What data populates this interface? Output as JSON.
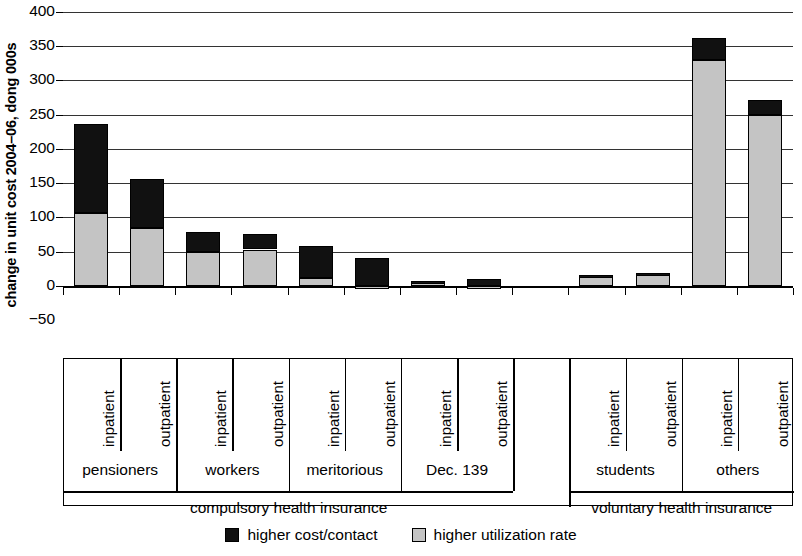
{
  "chart_data": {
    "type": "bar",
    "title": "",
    "subtitle": "",
    "stacked": true,
    "ylabel": "change in unit cost 2004–06, dong 000s",
    "xlabel": "",
    "ylim": [
      -50,
      400
    ],
    "yticks": [
      -50,
      0,
      50,
      100,
      150,
      200,
      250,
      300,
      350,
      400
    ],
    "ytick_labels": [
      "−50",
      "0",
      "50",
      "100",
      "150",
      "200",
      "250",
      "300",
      "350",
      "400"
    ],
    "grid": true,
    "legend_position": "bottom",
    "categories": [
      "pensioners inpatient",
      "pensioners outpatient",
      "workers inpatient",
      "workers outpatient",
      "meritorious inpatient",
      "meritorious outpatient",
      "Dec. 139 inpatient",
      "Dec. 139 outpatient",
      "students inpatient",
      "students outpatient",
      "others inpatient",
      "others outpatient"
    ],
    "series": [
      {
        "name": "higher utilization rate",
        "color": "#c4c4c4",
        "values": [
          107,
          85,
          50,
          53,
          12,
          -3,
          6,
          -2,
          14,
          17,
          330,
          250
        ]
      },
      {
        "name": "higher cost/contact",
        "color": "#111111",
        "values": [
          130,
          71,
          28,
          22,
          46,
          40,
          1,
          10,
          2,
          2,
          32,
          21
        ]
      }
    ],
    "totals": [
      237,
      156,
      78,
      75,
      58,
      37,
      7,
      8,
      16,
      19,
      362,
      271
    ]
  },
  "axis": {
    "y_title": "change in unit cost 2004–06, dong 000s",
    "ticks": [
      {
        "label": "400",
        "value": 400
      },
      {
        "label": "350",
        "value": 350
      },
      {
        "label": "300",
        "value": 300
      },
      {
        "label": "250",
        "value": 250
      },
      {
        "label": "200",
        "value": 200
      },
      {
        "label": "150",
        "value": 150
      },
      {
        "label": "100",
        "value": 100
      },
      {
        "label": "50",
        "value": 50
      },
      {
        "label": "0",
        "value": 0
      },
      {
        "label": "−50",
        "value": -50
      }
    ]
  },
  "bars": [
    {
      "name": "pensioners-inpatient",
      "grey": 107,
      "black": 130,
      "slot": 0
    },
    {
      "name": "pensioners-outpatient",
      "grey": 85,
      "black": 71,
      "slot": 1
    },
    {
      "name": "workers-inpatient",
      "grey": 50,
      "black": 28,
      "slot": 2
    },
    {
      "name": "workers-outpatient",
      "grey": 53,
      "black": 22,
      "slot": 3
    },
    {
      "name": "meritorious-inpatient",
      "grey": 12,
      "black": 46,
      "slot": 4
    },
    {
      "name": "meritorious-outpatient",
      "grey": -3,
      "black": 40,
      "slot": 5
    },
    {
      "name": "dec139-inpatient",
      "grey": 6,
      "black": 1,
      "slot": 6
    },
    {
      "name": "dec139-outpatient",
      "grey": -2,
      "black": 10,
      "slot": 7
    },
    {
      "name": "students-inpatient",
      "grey": 14,
      "black": 2,
      "slot": 9
    },
    {
      "name": "students-outpatient",
      "grey": 17,
      "black": 2,
      "slot": 10
    },
    {
      "name": "others-inpatient",
      "grey": 330,
      "black": 32,
      "slot": 11
    },
    {
      "name": "others-outpatient",
      "grey": 250,
      "black": 21,
      "slot": 12
    }
  ],
  "xlabels": {
    "sublabels": [
      "inpatient",
      "outpatient",
      "inpatient",
      "outpatient",
      "inpatient",
      "outpatient",
      "inpatient",
      "outpatient",
      "inpatient",
      "outpatient",
      "inpatient",
      "outpatient"
    ],
    "groups": [
      "pensioners",
      "workers",
      "meritorious",
      "Dec. 139",
      "students",
      "others"
    ],
    "supergroups": [
      "compulsory health insurance",
      "voluntary health insurance"
    ]
  },
  "legend": {
    "items": [
      {
        "label": "higher cost/contact",
        "swatch": "black"
      },
      {
        "label": "higher utilization rate",
        "swatch": "grey"
      }
    ]
  }
}
